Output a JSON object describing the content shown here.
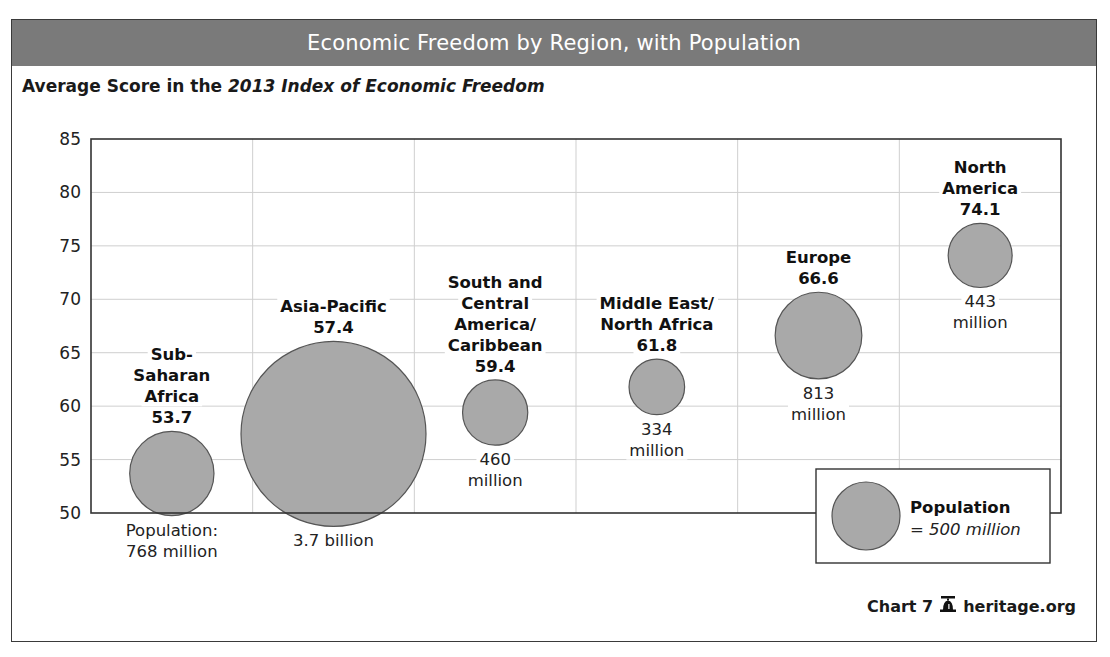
{
  "header": {
    "title": "Economic Freedom by Region, with Population"
  },
  "subtitle": {
    "prefix": "Average Score in the ",
    "italic": "2013 Index of Economic Freedom"
  },
  "footer": {
    "chart_label": "Chart 7",
    "icon": "liberty-bell-icon",
    "source": "heritage.org"
  },
  "legend": {
    "title": "Population",
    "subtitle": "= 500 million",
    "reference_population_millions": 500
  },
  "colors": {
    "header_bg": "#7a7a7a",
    "bubble_fill": "#a9a9a9",
    "bubble_stroke": "#555555",
    "grid": "#cfcfcf",
    "axis": "#333333"
  },
  "chart_data": {
    "type": "scatter",
    "subtype": "bubble",
    "title": "Economic Freedom by Region, with Population",
    "ylabel": "Average Score in the 2013 Index of Economic Freedom",
    "xlabel": "",
    "ylim": [
      50,
      85
    ],
    "yticks": [
      50,
      55,
      60,
      65,
      70,
      75,
      80,
      85
    ],
    "grid": true,
    "legend_position": "bottom-right",
    "categories": [
      "Sub-Saharan Africa",
      "Asia-Pacific",
      "South and Central America/Caribbean",
      "Middle East/North Africa",
      "Europe",
      "North America"
    ],
    "values": [
      53.7,
      57.4,
      59.4,
      61.8,
      66.6,
      74.1
    ],
    "population_millions": [
      768,
      3700,
      460,
      334,
      813,
      443
    ],
    "points": [
      {
        "region": "Sub-Saharan Africa",
        "name_lines": [
          "Sub-",
          "Saharan",
          "Africa"
        ],
        "score": 53.7,
        "score_label": "53.7",
        "population_millions": 768,
        "pop_lines": [
          "Population:",
          "768 million"
        ]
      },
      {
        "region": "Asia-Pacific",
        "name_lines": [
          "Asia-Pacific"
        ],
        "score": 57.4,
        "score_label": "57.4",
        "population_millions": 3700,
        "pop_lines": [
          "3.7 billion"
        ]
      },
      {
        "region": "South and Central America/Caribbean",
        "name_lines": [
          "South and",
          "Central",
          "America/",
          "Caribbean"
        ],
        "score": 59.4,
        "score_label": "59.4",
        "population_millions": 460,
        "pop_lines": [
          "460",
          "million"
        ]
      },
      {
        "region": "Middle East/North Africa",
        "name_lines": [
          "Middle East/",
          "North Africa"
        ],
        "score": 61.8,
        "score_label": "61.8",
        "population_millions": 334,
        "pop_lines": [
          "334",
          "million"
        ]
      },
      {
        "region": "Europe",
        "name_lines": [
          "Europe"
        ],
        "score": 66.6,
        "score_label": "66.6",
        "population_millions": 813,
        "pop_lines": [
          "813",
          "million"
        ]
      },
      {
        "region": "North America",
        "name_lines": [
          "North",
          "America"
        ],
        "score": 74.1,
        "score_label": "74.1",
        "population_millions": 443,
        "pop_lines": [
          "443",
          "million"
        ]
      }
    ]
  }
}
